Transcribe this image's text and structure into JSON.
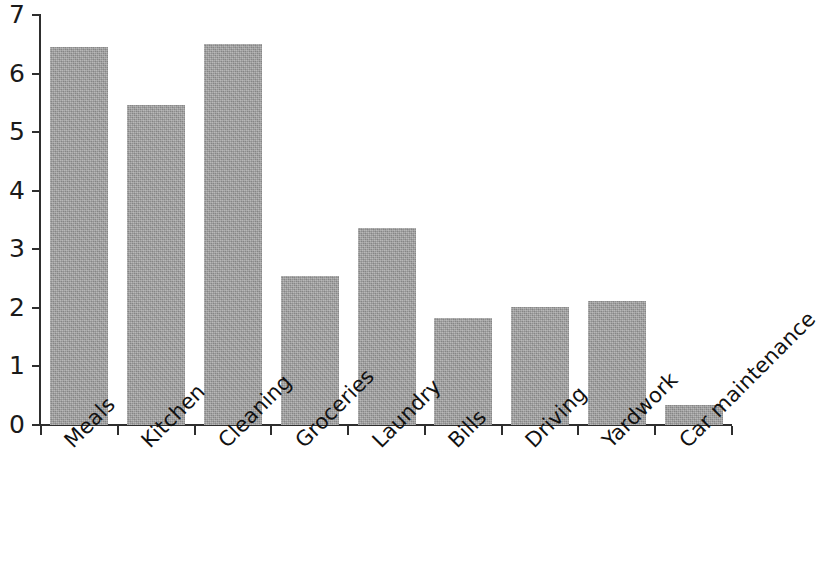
{
  "chart_data": {
    "type": "bar",
    "title": "",
    "subtitle": "",
    "xlabel": "",
    "ylabel": "",
    "categories": [
      "Meals",
      "Kitchen",
      "Cleaning",
      "Groceries",
      "Laundry",
      "Bills",
      "Driving",
      "Yardwork",
      "Car maintenance"
    ],
    "values": [
      6.45,
      5.47,
      6.5,
      2.55,
      3.36,
      1.83,
      2.02,
      2.11,
      0.34
    ],
    "ylim": [
      0,
      7
    ],
    "ytick_labels": [
      "7",
      "6",
      "5",
      "4",
      "3",
      "2",
      "1",
      "0"
    ],
    "ytick_values": [
      7,
      6,
      5,
      4,
      3,
      2,
      1,
      0
    ],
    "grid": false,
    "legend": null,
    "bar_color": "#9b9b9b",
    "axis_color": "#2e2e2e",
    "background_color": "#ffffff",
    "xtick_label_rotation": -45
  }
}
